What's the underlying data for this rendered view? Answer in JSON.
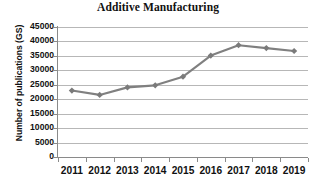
{
  "chart_data": {
    "type": "line",
    "title": "Additive Manufacturing",
    "xlabel": "",
    "ylabel": "Number of publications (GS)",
    "categories": [
      "2011",
      "2012",
      "2013",
      "2014",
      "2015",
      "2016",
      "2017",
      "2018",
      "2019"
    ],
    "values": [
      23000,
      21500,
      24100,
      24800,
      27800,
      35100,
      38700,
      37700,
      36700
    ],
    "series": [
      {
        "name": "Number of publications (GS)",
        "values": [
          23000,
          21500,
          24100,
          24800,
          27800,
          35100,
          38700,
          37700,
          36700
        ]
      }
    ],
    "ylim": [
      0,
      45000
    ],
    "ytick_step": 5000,
    "yticks": [
      "45000",
      "40000",
      "35000",
      "30000",
      "25000",
      "20000",
      "15000",
      "10000",
      "5000",
      "0"
    ],
    "ytick_values": [
      45000,
      40000,
      35000,
      30000,
      25000,
      20000,
      15000,
      10000,
      5000,
      0
    ],
    "grid": true,
    "legend": false,
    "legend_position": "none",
    "marker": "diamond",
    "colors": {
      "series_line": "#808080",
      "marker": "#7a7a7a",
      "gridline": "#b7b7b7",
      "axis": "#8a8a8a",
      "text": "#111111",
      "background": "#ffffff"
    }
  }
}
